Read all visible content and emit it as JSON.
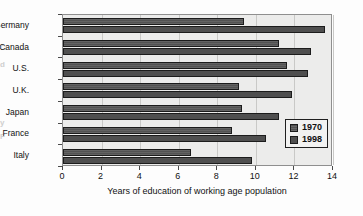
{
  "chart_data": {
    "type": "bar",
    "orientation": "horizontal",
    "title": "",
    "xlabel": "Years of education of working age population",
    "ylabel": "",
    "categories": [
      "Germany",
      "Canada",
      "U.S.",
      "U.K.",
      "Japan",
      "France",
      "Italy"
    ],
    "series": [
      {
        "name": "1970",
        "values": [
          9.4,
          11.2,
          11.6,
          9.1,
          9.3,
          8.75,
          6.65
        ]
      },
      {
        "name": "1998",
        "values": [
          13.6,
          12.85,
          12.7,
          11.85,
          11.2,
          10.5,
          9.8
        ]
      }
    ],
    "xlim": [
      0,
      14
    ],
    "xticks": [
      0,
      2,
      4,
      6,
      8,
      10,
      12,
      14
    ],
    "xticklabels": [
      "0",
      "2",
      "4",
      "6",
      "8",
      "10",
      "12",
      "14"
    ],
    "grid": "vertical",
    "legend_position": "lower-right-inside",
    "colors": {
      "series_1970": "#5d5d5d",
      "series_1998": "#4f4f4f",
      "bar_edge": "#1c1c1c",
      "plot_background": "#ececeb",
      "figure_background": "#fdfdfd",
      "gridline": "#c9c9c7",
      "axis": "#4a4a4a",
      "text": "#111111"
    }
  },
  "edge_artifacts": [
    {
      "text": "C",
      "top": 43
    },
    {
      "text": "d",
      "top": 60
    },
    {
      "text": "y",
      "top": 118
    },
    {
      "text": "F",
      "top": 132
    }
  ]
}
